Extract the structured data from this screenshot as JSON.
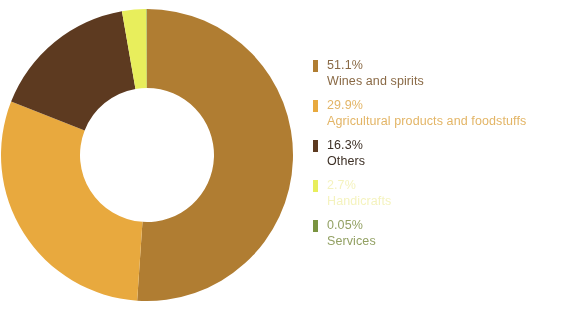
{
  "chart_data": {
    "type": "pie",
    "variant": "donut",
    "title": "",
    "subtitle": "",
    "xlabel": "",
    "ylabel": "",
    "grid": false,
    "legend_position": "right",
    "units": "percent",
    "start_angle_deg": 0,
    "direction": "clockwise",
    "inner_radius_ratio": 0.46,
    "categories": [
      "Wines and spirits",
      "Agricultural products and foodstuffs",
      "Others",
      "Handicrafts",
      "Services"
    ],
    "values": [
      51.1,
      29.9,
      16.3,
      2.7,
      0.05
    ],
    "value_labels": [
      "51.1%",
      "29.9%",
      "16.3%",
      "2.7%",
      "0.05%"
    ],
    "colors": [
      "#b07d32",
      "#e8a93e",
      "#5d3a20",
      "#e8ee5c",
      "#7a9440"
    ]
  },
  "legend": {
    "items": [
      {
        "percent": "51.1%",
        "label": "Wines and spirits",
        "color": "#b07d32",
        "text_color": "#8a6a46",
        "faded": false
      },
      {
        "percent": "29.9%",
        "label": "Agricultural products and foodstuffs",
        "color": "#e8a93e",
        "text_color": "#e3b566",
        "faded": false
      },
      {
        "percent": "16.3%",
        "label": "Others",
        "color": "#5d3a20",
        "text_color": "#3d3026",
        "faded": false
      },
      {
        "percent": "2.7%",
        "label": "Handicrafts",
        "color": "#e8ee5c",
        "text_color": "#ece98a",
        "faded": true
      },
      {
        "percent": "0.05%",
        "label": "Services",
        "color": "#7a9440",
        "text_color": "#93a164",
        "faded": false
      }
    ]
  },
  "donut": {
    "center_x": 147,
    "center_y": 156,
    "outer_radius": 146,
    "inner_radius": 67,
    "background": "#ffffff"
  }
}
